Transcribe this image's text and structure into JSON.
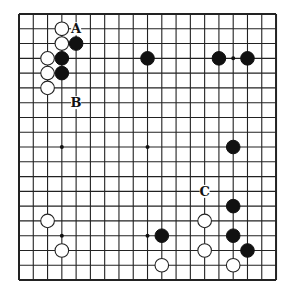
{
  "board": {
    "size": 19,
    "origin": {
      "x": 19,
      "y": 14
    },
    "spacing": {
      "x": 14.28,
      "y": 14.78
    },
    "line_color": "#222222",
    "background": "#ffffff",
    "star_points": [
      [
        3,
        3
      ],
      [
        9,
        3
      ],
      [
        15,
        3
      ],
      [
        3,
        9
      ],
      [
        9,
        9
      ],
      [
        15,
        9
      ],
      [
        3,
        15
      ],
      [
        9,
        15
      ],
      [
        15,
        15
      ]
    ]
  },
  "stones": {
    "black": [
      [
        4,
        2
      ],
      [
        3,
        3
      ],
      [
        3,
        4
      ],
      [
        9,
        3
      ],
      [
        14,
        3
      ],
      [
        16,
        3
      ],
      [
        15,
        9
      ],
      [
        15,
        13
      ],
      [
        10,
        15
      ],
      [
        15,
        15
      ],
      [
        16,
        16
      ]
    ],
    "white": [
      [
        3,
        1
      ],
      [
        3,
        2
      ],
      [
        2,
        3
      ],
      [
        2,
        4
      ],
      [
        2,
        5
      ],
      [
        2,
        14
      ],
      [
        3,
        16
      ],
      [
        13,
        14
      ],
      [
        13,
        16
      ],
      [
        10,
        17
      ],
      [
        15,
        17
      ]
    ]
  },
  "labels": [
    {
      "text": "A",
      "col": 4,
      "row": 1
    },
    {
      "text": "B",
      "col": 4,
      "row": 6
    },
    {
      "text": "C",
      "col": 13,
      "row": 12
    }
  ]
}
